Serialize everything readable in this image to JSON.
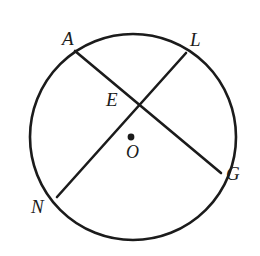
{
  "figure": {
    "background_color": "#ffffff",
    "stroke_color": "#1b1b1b",
    "label_color": "#1b1b1b",
    "width": 260,
    "height": 256
  },
  "circle": {
    "name": "circle-O",
    "center_label": "O",
    "center_x": 133,
    "center_y": 137,
    "radius": 103,
    "stroke_width": 2.6
  },
  "center_point": {
    "label": "O",
    "x": 131,
    "y": 137,
    "dot_radius": 3.4
  },
  "chords": [
    {
      "name": "chord-AG",
      "from": "A",
      "to": "G",
      "x1": 75,
      "y1": 51,
      "x2": 221,
      "y2": 173,
      "stroke_width": 2.6
    },
    {
      "name": "chord-LN",
      "from": "L",
      "to": "N",
      "x1": 186,
      "y1": 53,
      "x2": 57,
      "y2": 197,
      "stroke_width": 2.6
    }
  ],
  "intersection": {
    "label": "E",
    "x": 142,
    "y": 103
  },
  "labels": {
    "A": "A",
    "L": "L",
    "E": "E",
    "O": "O",
    "G": "G",
    "N": "N"
  }
}
